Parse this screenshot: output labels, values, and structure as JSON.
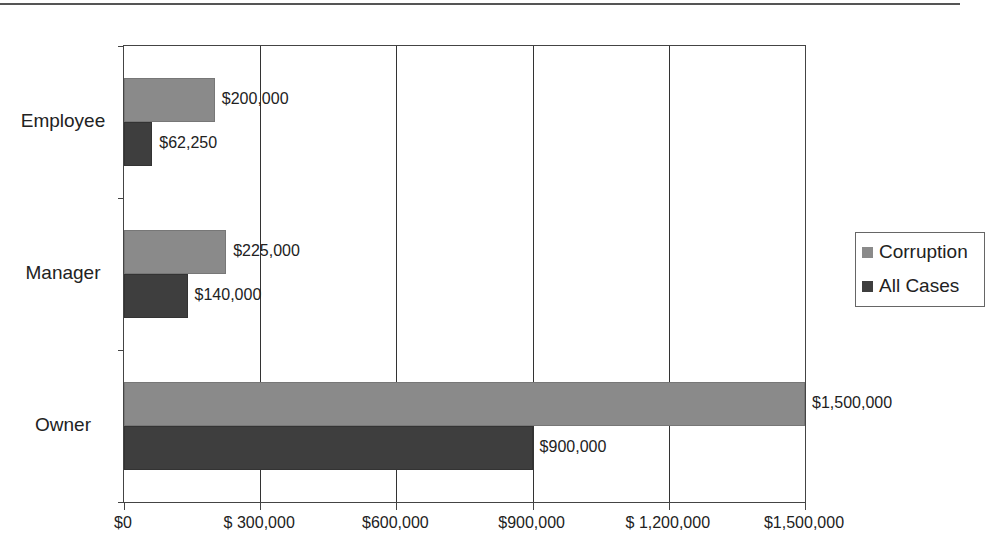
{
  "chart_data": {
    "type": "bar",
    "orientation": "horizontal",
    "title": "",
    "xlabel": "",
    "ylabel": "",
    "categories": [
      "Employee",
      "Manager",
      "Owner"
    ],
    "series": [
      {
        "name": "Corruption",
        "color": "#8a8a8a",
        "values": [
          200000,
          225000,
          1500000
        ]
      },
      {
        "name": "All Cases",
        "color": "#3e3e3e",
        "values": [
          62250,
          140000,
          900000
        ]
      }
    ],
    "xlim": [
      0,
      1500000
    ],
    "x_ticks": [
      "$0",
      "$ 300,000",
      "$600,000",
      "$900,000",
      "$ 1,200,000",
      "$1,500,000"
    ],
    "data_labels": {
      "Corruption": [
        "$200,000",
        "$225,000",
        "$1,500,000"
      ],
      "All Cases": [
        "$62,250",
        "$140,000",
        "$900,000"
      ]
    },
    "grid": "vertical",
    "legend_position": "right"
  },
  "legend": {
    "items": [
      "Corruption",
      "All Cases"
    ]
  }
}
